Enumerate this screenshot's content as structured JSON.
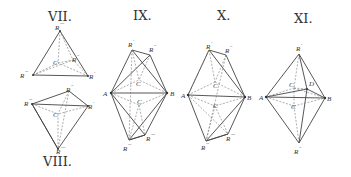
{
  "figures": [
    {
      "id": "VII",
      "title": "VII.",
      "labels": {
        "top": "R",
        "top_sup": "''''",
        "left": "R",
        "left_sup": "'''",
        "right": "R",
        "right_sup": "'",
        "back": "R",
        "back_sup": "''",
        "center": "C"
      }
    },
    {
      "id": "VIII",
      "title": "VIII.",
      "labels": {
        "left": "R",
        "left_sup": "'''",
        "top": "R",
        "top_sup": "''",
        "right": "R",
        "right_sup": "'",
        "bottom": "R",
        "bottom_sup": "''''",
        "center": "C"
      }
    },
    {
      "id": "IX",
      "title": "IX.",
      "labels": {
        "r1": "R",
        "r1_sup": "'",
        "r2": "R",
        "r2_sup": "''",
        "r3": "R",
        "r3_sup": "'''",
        "r4": "R",
        "r4_sup": "''''",
        "a": "A",
        "b": "B",
        "c1": "C",
        "c2": "C"
      }
    },
    {
      "id": "X",
      "title": "X.",
      "labels": {
        "r1": "R",
        "r1_sup": "'",
        "r2": "R",
        "r2_sup": "''",
        "r3": "R",
        "r3_sup": "'''",
        "r4": "R",
        "r4_sup": "''''",
        "a": "A",
        "b": "B",
        "c1": "C",
        "c2": "C"
      }
    },
    {
      "id": "XI",
      "title": "XI.",
      "labels": {
        "r1": "R",
        "r1_sup": "'",
        "r2": "R",
        "r2_sup": "''",
        "a": "A",
        "b": "B",
        "c1": "C",
        "c2": "C",
        "d": "D"
      }
    }
  ]
}
